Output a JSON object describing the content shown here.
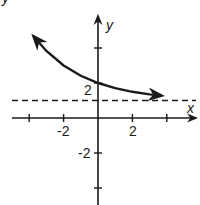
{
  "header": {
    "cut_off_text": "y"
  },
  "chart_data": {
    "type": "line",
    "title": "",
    "xlabel": "x",
    "ylabel": "y",
    "x_tick_labels": [
      "-2",
      "2"
    ],
    "y_tick_labels": [
      "2",
      "-2"
    ],
    "x_ticks": [
      -4,
      -2,
      0,
      2,
      4
    ],
    "y_ticks": [
      4,
      2,
      -2,
      -4
    ],
    "xlim": [
      -4,
      5
    ],
    "ylim": [
      -5,
      6
    ],
    "grid": false,
    "series": [
      {
        "name": "exponential decay curve",
        "style": "solid",
        "arrows": "both",
        "x": [
          -3.75,
          -3,
          -2,
          -1,
          0,
          1,
          2,
          3,
          3.7
        ],
        "y": [
          4.67,
          3.83,
          3.0,
          2.41,
          2.0,
          1.71,
          1.5,
          1.35,
          1.28
        ]
      },
      {
        "name": "horizontal asymptote",
        "style": "dashed",
        "equation": "y = 1",
        "x": [
          -4,
          5
        ],
        "y": [
          1,
          1
        ]
      }
    ],
    "annotations": [
      {
        "text": "2",
        "at": "y-intercept label",
        "x": 0,
        "y": 2
      }
    ]
  },
  "colors": {
    "ink": "#1a1a1a",
    "background": "#ffffff"
  }
}
